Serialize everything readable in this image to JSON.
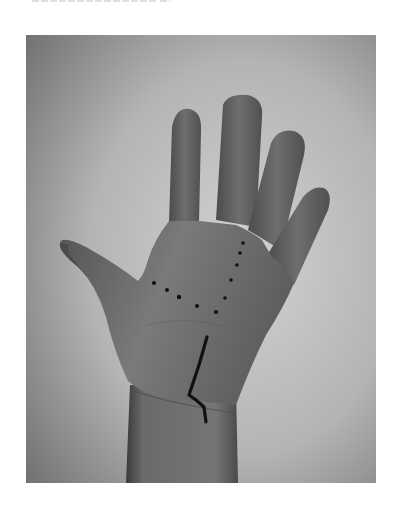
{
  "page": {
    "background": "#ffffff",
    "top_text_cutoff": true
  },
  "photo": {
    "subject": "open right hand palm facing viewer",
    "description": "Grayscale photograph of an open hand with a dotted line marked across the palm and a solid ink line drawn from mid-palm to the wrist crease",
    "frame": {
      "x": 26,
      "y": 35,
      "width": 350,
      "height": 448
    },
    "colors": {
      "background_dark": "#6e6e6e",
      "background_light": "#cfcfcf",
      "skin": "#747474",
      "skin_shadow": "#4a4a4a",
      "ink": "#111111"
    },
    "markings": {
      "dots": [
        {
          "x": 128,
          "y": 248
        },
        {
          "x": 141,
          "y": 255
        },
        {
          "x": 153,
          "y": 262
        },
        {
          "x": 171,
          "y": 271
        },
        {
          "x": 190,
          "y": 277
        },
        {
          "x": 199,
          "y": 263
        },
        {
          "x": 205,
          "y": 245
        },
        {
          "x": 211,
          "y": 230
        },
        {
          "x": 214,
          "y": 218
        },
        {
          "x": 217,
          "y": 208
        }
      ],
      "line_points": "181,302 173,330 163,360 170,365 178,372 180,387"
    }
  }
}
